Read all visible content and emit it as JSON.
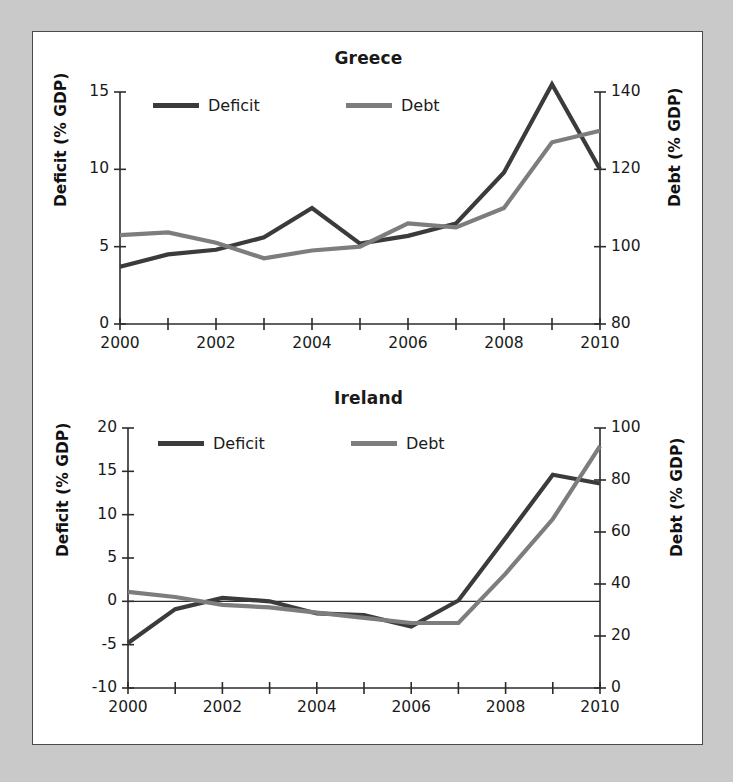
{
  "figure": {
    "background_color": "#c9c9c9",
    "panel_color": "#ffffff",
    "border_color": "#4a4a4a"
  },
  "colors": {
    "deficit": "#3b3b3b",
    "debt": "#7d7d7d",
    "axis": "#2b2b2b",
    "text": "#1a1a1a"
  },
  "legend": {
    "deficit_label": "Deficit",
    "debt_label": "Debt"
  },
  "chart_data": [
    {
      "type": "line",
      "title": "Greece",
      "xlabel": "",
      "ylabel": "Deficit (% GDP)",
      "y2label": "Debt (% GDP)",
      "x": [
        2000,
        2001,
        2002,
        2003,
        2004,
        2005,
        2006,
        2007,
        2008,
        2009,
        2010
      ],
      "xlim": [
        2000,
        2010
      ],
      "xticks": [
        2000,
        2001,
        2002,
        2003,
        2004,
        2005,
        2006,
        2007,
        2008,
        2009,
        2010
      ],
      "xticklabels": [
        "2000",
        "",
        "2002",
        "",
        "2004",
        "",
        "2006",
        "",
        "2008",
        "",
        "2010"
      ],
      "ylim": [
        0,
        15
      ],
      "yticks": [
        0,
        5,
        10,
        15
      ],
      "yticklabels": [
        "0",
        "5",
        "10",
        "15"
      ],
      "y2lim": [
        80,
        140
      ],
      "y2ticks": [
        80,
        100,
        120,
        140
      ],
      "y2ticklabels": [
        "80",
        "100",
        "120",
        "140"
      ],
      "grid": false,
      "legend_position": "upper-left-inside",
      "series": [
        {
          "name": "Deficit",
          "axis": "left",
          "color": "#3b3b3b",
          "values": [
            3.7,
            4.5,
            4.8,
            5.6,
            7.5,
            5.2,
            5.7,
            6.5,
            9.8,
            15.5,
            10.0
          ]
        },
        {
          "name": "Debt",
          "axis": "right",
          "color": "#7d7d7d",
          "values": [
            103,
            103.7,
            101,
            97,
            99,
            100,
            106,
            105,
            110,
            127,
            130
          ]
        }
      ]
    },
    {
      "type": "line",
      "title": "Ireland",
      "xlabel": "",
      "ylabel": "Deficit (% GDP)",
      "y2label": "Debt (% GDP)",
      "x": [
        2000,
        2001,
        2002,
        2003,
        2004,
        2005,
        2006,
        2007,
        2008,
        2009,
        2010
      ],
      "xlim": [
        2000,
        2010
      ],
      "xticks": [
        2000,
        2001,
        2002,
        2003,
        2004,
        2005,
        2006,
        2007,
        2008,
        2009,
        2010
      ],
      "xticklabels": [
        "2000",
        "",
        "2002",
        "",
        "2004",
        "",
        "2006",
        "",
        "2008",
        "",
        "2010"
      ],
      "ylim": [
        -10,
        20
      ],
      "yticks": [
        -10,
        -5,
        0,
        5,
        10,
        15,
        20
      ],
      "yticklabels": [
        "-10",
        "-5",
        "0",
        "5",
        "10",
        "15",
        "20"
      ],
      "y2lim": [
        0,
        100
      ],
      "y2ticks": [
        0,
        20,
        40,
        60,
        80,
        100
      ],
      "y2ticklabels": [
        "0",
        "20",
        "40",
        "60",
        "80",
        "100"
      ],
      "grid": false,
      "legend_position": "upper-left-inside",
      "series": [
        {
          "name": "Deficit",
          "axis": "left",
          "color": "#3b3b3b",
          "values": [
            -4.8,
            -0.9,
            0.4,
            0.0,
            -1.4,
            -1.6,
            -2.9,
            0.1,
            7.3,
            14.6,
            13.6
          ]
        },
        {
          "name": "Debt",
          "axis": "right",
          "color": "#7d7d7d",
          "values": [
            37,
            35,
            32,
            31,
            29,
            27,
            25,
            25,
            44,
            65,
            93
          ]
        }
      ]
    }
  ]
}
